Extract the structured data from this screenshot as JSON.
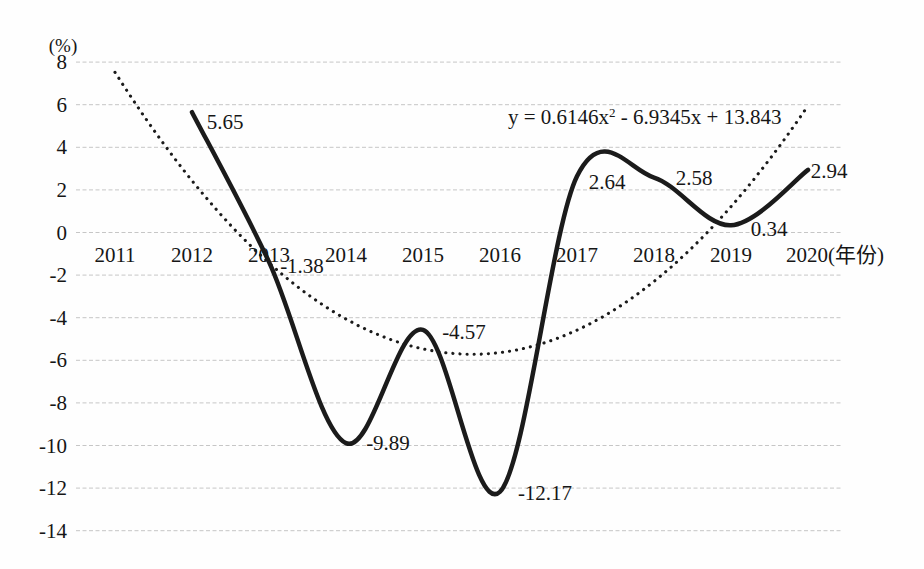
{
  "chart_data": {
    "type": "line",
    "title": "",
    "ylabel_unit": "(%)",
    "xlabel_suffix": "(年份)",
    "categories": [
      "2011",
      "2012",
      "2013",
      "2014",
      "2015",
      "2016",
      "2017",
      "2018",
      "2019",
      "2020"
    ],
    "series": [
      {
        "x": [
          "2012",
          "2013",
          "2014",
          "2015",
          "2016",
          "2017",
          "2018",
          "2019",
          "2020"
        ],
        "values": [
          5.65,
          -1.38,
          -9.89,
          -4.57,
          -12.17,
          2.64,
          2.58,
          0.34,
          2.94
        ],
        "data_labels": [
          "5.65",
          "-1.38",
          "-9.89",
          "-4.57",
          "-12.17",
          "2.64",
          "2.58",
          "0.34",
          "2.94"
        ],
        "style": "solid",
        "color": "#1b1b1b"
      }
    ],
    "trendline": {
      "equation_prefix": "y = 0.6146x",
      "equation_sup": "2",
      "equation_suffix": " - 6.9345x + 13.843",
      "a": 0.6146,
      "b": -6.9345,
      "c": 13.843,
      "x_domain": [
        1,
        10
      ],
      "style": "dotted",
      "color": "#1b1b1b"
    },
    "ylim": [
      -14,
      8
    ],
    "ytick_step": 2,
    "yticks": [
      8,
      6,
      4,
      2,
      0,
      -2,
      -4,
      -6,
      -8,
      -10,
      -12,
      -14
    ],
    "grid": true,
    "grid_color": "#c6c6c6",
    "legend": "none"
  }
}
